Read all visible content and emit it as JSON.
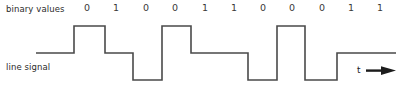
{
  "figure": {
    "width": 402,
    "height": 95,
    "background_color": "#ffffff",
    "binary_values_label": "binary values",
    "line_signal_label": "line signal",
    "time_axis_label": "t",
    "time_arrow_icon": "right-arrow-icon"
  },
  "chart_data": {
    "type": "line",
    "title": "",
    "xlabel": "t",
    "ylabel": "",
    "grid": false,
    "legend": "none",
    "categories": [
      "0",
      "1",
      "0",
      "0",
      "1",
      "1",
      "0",
      "0",
      "0",
      "1",
      "1"
    ],
    "bit_labels": [
      "0",
      "1",
      "0",
      "0",
      "1",
      "1",
      "0",
      "0",
      "0",
      "1",
      "1"
    ],
    "bit_label_x": [
      87,
      116,
      146,
      175,
      205,
      234,
      263,
      292,
      322,
      351,
      380
    ],
    "levels": {
      "high": 26,
      "mid": 53,
      "low": 80
    },
    "signal_color": "#4a4a4a",
    "line_width": 1.6,
    "segments": [
      {
        "level": "mid",
        "x0": 36,
        "x1": 74
      },
      {
        "level": "high",
        "x0": 74,
        "x1": 105
      },
      {
        "level": "mid",
        "x0": 105,
        "x1": 133
      },
      {
        "level": "low",
        "x0": 133,
        "x1": 162
      },
      {
        "level": "high",
        "x0": 162,
        "x1": 191
      },
      {
        "level": "mid",
        "x0": 191,
        "x1": 248
      },
      {
        "level": "low",
        "x0": 248,
        "x1": 277
      },
      {
        "level": "high",
        "x0": 277,
        "x1": 305
      },
      {
        "level": "low",
        "x0": 305,
        "x1": 337
      },
      {
        "level": "mid",
        "x0": 337,
        "x1": 396
      }
    ],
    "ylim": [
      80,
      26
    ],
    "xlim": [
      36,
      396
    ]
  }
}
